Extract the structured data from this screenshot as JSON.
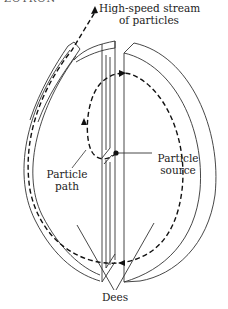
{
  "figure": {
    "title_fragment": "ZOTRON",
    "labels": {
      "stream_line1": "High-speed stream",
      "stream_line2": "of particles",
      "source_line1": "Particle",
      "source_line2": "source",
      "path_line1": "Particle",
      "path_line2": "path",
      "dees": "Dees"
    },
    "colors": {
      "line": "#333333",
      "dashed_path": "#111111",
      "background": "#ffffff"
    }
  }
}
